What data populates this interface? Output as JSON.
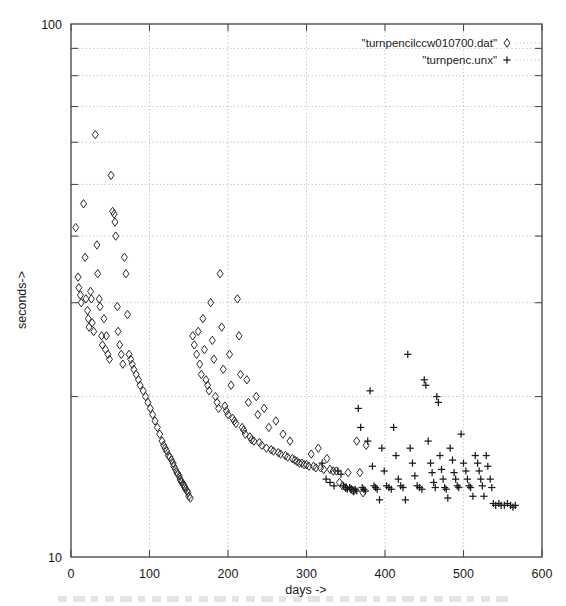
{
  "chart_data": {
    "type": "scatter",
    "title": "",
    "xlabel": "days ->",
    "ylabel": "seconds->",
    "xlim": [
      0,
      600
    ],
    "ylim": [
      10,
      100
    ],
    "yscale": "log",
    "xscale": "linear",
    "grid": true,
    "legend_position": "top-right",
    "xticks": [
      0,
      100,
      200,
      300,
      400,
      500,
      600
    ],
    "xtick_labels": [
      "0",
      "100",
      "200",
      "300",
      "400",
      "500",
      "600"
    ],
    "yticks": [
      10,
      100
    ],
    "ytick_labels": [
      "10",
      "100"
    ],
    "y_minor_gridlines": [
      20,
      30,
      40,
      50,
      60,
      70,
      80,
      90
    ],
    "series": [
      {
        "name": "\"turnpencilccw010700.dat\"",
        "marker": "diamond",
        "color": "#2b2b2b",
        "points": [
          [
            6,
            41.5
          ],
          [
            9,
            33.5
          ],
          [
            10,
            32.0
          ],
          [
            12,
            31.0
          ],
          [
            13,
            30.0
          ],
          [
            16,
            46.0
          ],
          [
            18,
            36.5
          ],
          [
            19,
            30.5
          ],
          [
            21,
            29.0
          ],
          [
            22,
            28.0
          ],
          [
            23,
            27.0
          ],
          [
            25,
            31.5
          ],
          [
            26,
            30.5
          ],
          [
            27,
            27.5
          ],
          [
            29,
            26.5
          ],
          [
            31,
            62.0
          ],
          [
            33,
            38.5
          ],
          [
            34,
            34.0
          ],
          [
            36,
            30.5
          ],
          [
            37,
            29.5
          ],
          [
            39,
            26.0
          ],
          [
            40,
            25.0
          ],
          [
            42,
            28.0
          ],
          [
            44,
            24.5
          ],
          [
            45,
            26.0
          ],
          [
            47,
            24.0
          ],
          [
            49,
            23.5
          ],
          [
            51,
            52.0
          ],
          [
            53,
            44.5
          ],
          [
            55,
            44.0
          ],
          [
            56,
            42.5
          ],
          [
            57,
            40.0
          ],
          [
            59,
            29.5
          ],
          [
            60,
            26.5
          ],
          [
            62,
            25.0
          ],
          [
            64,
            24.0
          ],
          [
            66,
            23.0
          ],
          [
            68,
            36.5
          ],
          [
            70,
            34.0
          ],
          [
            72,
            28.5
          ],
          [
            74,
            24.0
          ],
          [
            76,
            23.5
          ],
          [
            78,
            23.0
          ],
          [
            80,
            22.5
          ],
          [
            83,
            22.0
          ],
          [
            86,
            21.5
          ],
          [
            88,
            21.0
          ],
          [
            92,
            20.5
          ],
          [
            95,
            20.0
          ],
          [
            98,
            19.5
          ],
          [
            101,
            19.0
          ],
          [
            104,
            18.5
          ],
          [
            107,
            18.0
          ],
          [
            110,
            17.5
          ],
          [
            113,
            17.0
          ],
          [
            116,
            16.5
          ],
          [
            118,
            16.2
          ],
          [
            120,
            16.0
          ],
          [
            122,
            15.8
          ],
          [
            124,
            15.5
          ],
          [
            126,
            15.4
          ],
          [
            128,
            15.2
          ],
          [
            130,
            15.0
          ],
          [
            131,
            14.8
          ],
          [
            133,
            14.6
          ],
          [
            135,
            14.4
          ],
          [
            136,
            14.3
          ],
          [
            138,
            14.2
          ],
          [
            139,
            14.0
          ],
          [
            140,
            13.9
          ],
          [
            141,
            13.8
          ],
          [
            143,
            13.7
          ],
          [
            144,
            13.6
          ],
          [
            145,
            13.5
          ],
          [
            146,
            13.4
          ],
          [
            148,
            13.3
          ],
          [
            149,
            13.2
          ],
          [
            150,
            13.0
          ],
          [
            152,
            12.9
          ],
          [
            155,
            26.0
          ],
          [
            157,
            25.0
          ],
          [
            160,
            24.0
          ],
          [
            162,
            26.5
          ],
          [
            164,
            23.0
          ],
          [
            166,
            22.0
          ],
          [
            168,
            28.0
          ],
          [
            170,
            24.5
          ],
          [
            172,
            21.5
          ],
          [
            174,
            21.0
          ],
          [
            176,
            20.5
          ],
          [
            178,
            30.0
          ],
          [
            180,
            25.5
          ],
          [
            182,
            23.5
          ],
          [
            184,
            20.0
          ],
          [
            186,
            19.5
          ],
          [
            188,
            19.0
          ],
          [
            190,
            34.0
          ],
          [
            192,
            27.0
          ],
          [
            194,
            22.5
          ],
          [
            196,
            19.2
          ],
          [
            198,
            18.8
          ],
          [
            200,
            18.5
          ],
          [
            202,
            24.0
          ],
          [
            204,
            21.0
          ],
          [
            206,
            18.2
          ],
          [
            208,
            18.0
          ],
          [
            210,
            17.8
          ],
          [
            212,
            30.5
          ],
          [
            214,
            26.0
          ],
          [
            216,
            22.0
          ],
          [
            218,
            17.5
          ],
          [
            220,
            17.3
          ],
          [
            222,
            17.0
          ],
          [
            224,
            21.5
          ],
          [
            226,
            19.5
          ],
          [
            228,
            16.8
          ],
          [
            230,
            16.6
          ],
          [
            233,
            16.5
          ],
          [
            236,
            20.0
          ],
          [
            238,
            18.5
          ],
          [
            240,
            16.4
          ],
          [
            243,
            16.2
          ],
          [
            246,
            19.0
          ],
          [
            249,
            16.0
          ],
          [
            252,
            17.5
          ],
          [
            255,
            15.9
          ],
          [
            258,
            15.8
          ],
          [
            261,
            18.0
          ],
          [
            264,
            15.7
          ],
          [
            267,
            15.6
          ],
          [
            270,
            17.0
          ],
          [
            273,
            15.5
          ],
          [
            276,
            15.4
          ],
          [
            279,
            16.5
          ],
          [
            282,
            15.3
          ],
          [
            285,
            15.2
          ],
          [
            288,
            15.1
          ],
          [
            291,
            15.0
          ],
          [
            294,
            15.0
          ],
          [
            297,
            14.9
          ],
          [
            300,
            14.9
          ],
          [
            303,
            14.8
          ],
          [
            306,
            15.6
          ],
          [
            309,
            14.8
          ],
          [
            312,
            14.7
          ],
          [
            315,
            16.0
          ],
          [
            318,
            14.7
          ],
          [
            322,
            14.6
          ],
          [
            326,
            15.3
          ],
          [
            330,
            14.6
          ],
          [
            334,
            14.5
          ],
          [
            338,
            14.5
          ],
          [
            342,
            13.8
          ],
          [
            346,
            13.6
          ],
          [
            350,
            13.5
          ],
          [
            353,
            14.4
          ],
          [
            357,
            13.4
          ],
          [
            360,
            13.3
          ],
          [
            364,
            16.5
          ],
          [
            368,
            14.4
          ],
          [
            372,
            13.2
          ],
          [
            376,
            16.2
          ]
        ]
      },
      {
        "name": "\"turnpenc.unx\"",
        "marker": "plus",
        "color": "#1a1a1a",
        "points": [
          [
            340,
            14.5
          ],
          [
            344,
            14.3
          ],
          [
            347,
            13.6
          ],
          [
            350,
            13.5
          ],
          [
            352,
            13.4
          ],
          [
            355,
            13.5
          ],
          [
            357,
            13.4
          ],
          [
            360,
            13.3
          ],
          [
            362,
            13.4
          ],
          [
            364,
            13.3
          ],
          [
            366,
            19.0
          ],
          [
            369,
            17.5
          ],
          [
            371,
            13.5
          ],
          [
            373,
            13.4
          ],
          [
            375,
            13.3
          ],
          [
            378,
            16.5
          ],
          [
            381,
            20.5
          ],
          [
            384,
            14.8
          ],
          [
            386,
            13.6
          ],
          [
            388,
            13.5
          ],
          [
            390,
            13.4
          ],
          [
            393,
            12.8
          ],
          [
            396,
            16.0
          ],
          [
            399,
            14.5
          ],
          [
            402,
            13.6
          ],
          [
            405,
            13.5
          ],
          [
            408,
            13.4
          ],
          [
            411,
            17.5
          ],
          [
            414,
            15.5
          ],
          [
            417,
            14.0
          ],
          [
            420,
            13.6
          ],
          [
            423,
            13.5
          ],
          [
            426,
            12.8
          ],
          [
            429,
            24.0
          ],
          [
            432,
            16.0
          ],
          [
            435,
            15.0
          ],
          [
            438,
            14.2
          ],
          [
            441,
            13.6
          ],
          [
            444,
            13.5
          ],
          [
            447,
            13.4
          ],
          [
            450,
            21.5
          ],
          [
            452,
            21.0
          ],
          [
            455,
            16.5
          ],
          [
            458,
            15.0
          ],
          [
            460,
            14.4
          ],
          [
            462,
            13.8
          ],
          [
            464,
            13.5
          ],
          [
            466,
            20.0
          ],
          [
            468,
            19.5
          ],
          [
            470,
            15.5
          ],
          [
            472,
            14.6
          ],
          [
            474,
            14.0
          ],
          [
            476,
            13.5
          ],
          [
            478,
            13.4
          ],
          [
            480,
            12.9
          ],
          [
            483,
            16.0
          ],
          [
            486,
            15.2
          ],
          [
            488,
            14.4
          ],
          [
            490,
            14.0
          ],
          [
            492,
            13.6
          ],
          [
            494,
            13.5
          ],
          [
            497,
            17.0
          ],
          [
            500,
            15.0
          ],
          [
            503,
            14.5
          ],
          [
            505,
            14.0
          ],
          [
            507,
            13.6
          ],
          [
            509,
            13.5
          ],
          [
            512,
            13.0
          ],
          [
            515,
            15.5
          ],
          [
            518,
            15.0
          ],
          [
            520,
            14.5
          ],
          [
            522,
            14.0
          ],
          [
            524,
            13.6
          ],
          [
            526,
            13.0
          ],
          [
            529,
            15.5
          ],
          [
            531,
            14.8
          ],
          [
            534,
            14.0
          ],
          [
            536,
            13.5
          ],
          [
            538,
            12.6
          ],
          [
            541,
            12.5
          ],
          [
            545,
            12.6
          ],
          [
            548,
            12.5
          ],
          [
            552,
            12.5
          ],
          [
            556,
            12.6
          ],
          [
            560,
            12.5
          ],
          [
            563,
            12.4
          ],
          [
            566,
            12.5
          ],
          [
            320,
            15.0
          ],
          [
            325,
            14.0
          ],
          [
            330,
            13.8
          ],
          [
            335,
            13.6
          ]
        ]
      }
    ]
  },
  "axes": {
    "x_title": "days ->",
    "y_title": "seconds->",
    "y_top_label": "100",
    "y_bottom_label": "10"
  },
  "legend": {
    "entries": [
      {
        "label": "\"turnpencilccw010700.dat\"",
        "marker": "diamond"
      },
      {
        "label": "\"turnpenc.unx\"",
        "marker": "plus"
      }
    ]
  },
  "colors": {
    "background": "#ffffff",
    "frame": "#4d4d4d",
    "grid": "#b4b4b4",
    "marker": "#2b2b2b",
    "text": "#1a1a1a"
  }
}
